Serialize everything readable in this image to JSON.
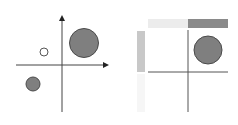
{
  "figure": {
    "panels": [
      {
        "id": "scatter-quadrant",
        "description": "Four-quadrant axes with three circles",
        "points": [
          {
            "label": "large-filled",
            "quadrant": "I",
            "fill": "#7f7f7f"
          },
          {
            "label": "small-open",
            "quadrant": "II",
            "fill": "#ffffff"
          },
          {
            "label": "medium-filled",
            "quadrant": "III",
            "fill": "#7f7f7f"
          }
        ]
      },
      {
        "id": "marginal-quadrant",
        "description": "Quadrant axes with marginal bars and one circle",
        "bars": {
          "top_left": "#ececec",
          "top_right": "#8a8a8a",
          "left_top": "#c8c8c8",
          "left_bottom": "#f6f6f6"
        },
        "points": [
          {
            "label": "large-filled",
            "quadrant": "I",
            "fill": "#7f7f7f"
          }
        ]
      }
    ],
    "colors": {
      "axis": "#444444",
      "circle_fill": "#7f7f7f",
      "circle_stroke": "#4a4a4a"
    }
  }
}
